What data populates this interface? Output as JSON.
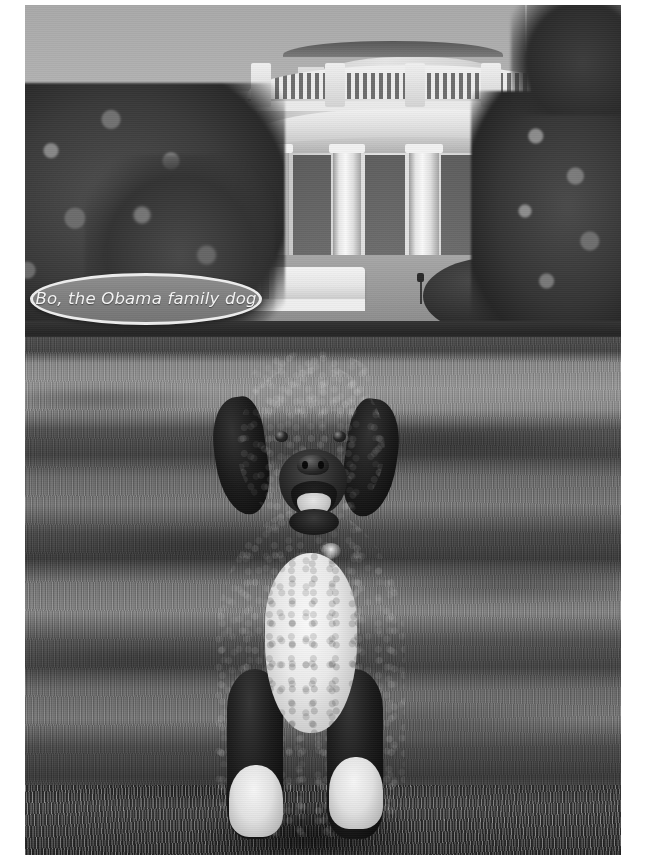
{
  "image": {
    "kind": "photograph",
    "treatment": "black-and-white",
    "subject": "Bo, the Obama family dog",
    "setting": "White House South Lawn",
    "border_color": "#ffffff"
  },
  "caption": {
    "text": "Bo, the Obama family dog",
    "bubble_shape": "ellipse",
    "bubble_fill": "#828080",
    "bubble_outline": "#efeee9",
    "text_color": "#f7f6f2"
  },
  "scene": {
    "sky_label": "sky",
    "building_label": "White House South Portico",
    "lawn_label": "South Lawn grass",
    "tree_left_label": "tree",
    "tree_right_label": "tree",
    "hedge_label": "hedge row",
    "awning_label": "awning",
    "dog_label": "portuguese water dog"
  },
  "colors": {
    "sky": "#b4b4b4",
    "stone": "#e7e5df",
    "column": "#fbf9f3",
    "lawn_light": "#9b998f",
    "lawn_shadow": "#46443f",
    "dog_coat": "#161414",
    "dog_chest": "#f4f2ed",
    "foliage": "#3b3936"
  }
}
